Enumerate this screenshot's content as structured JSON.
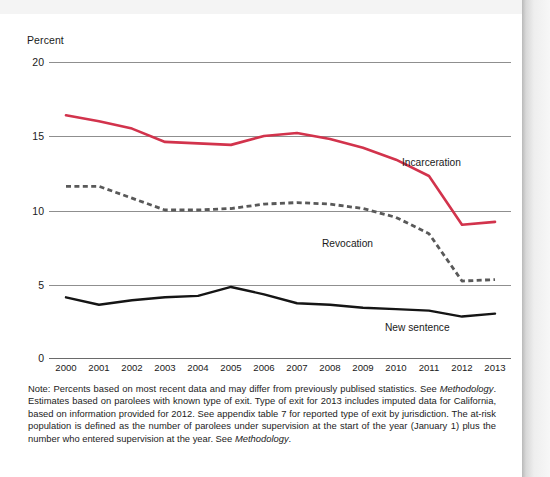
{
  "chart_data": {
    "type": "line",
    "title": "",
    "xlabel": "",
    "ylabel": "Percent",
    "ylim": [
      0,
      20
    ],
    "yticks": [
      0,
      5,
      10,
      15,
      20
    ],
    "grid": true,
    "legend_position": "inline-annotations",
    "categories": [
      "2000",
      "2001",
      "2002",
      "2003",
      "2004",
      "2005",
      "2006",
      "2007",
      "2008",
      "2009",
      "2010",
      "2011",
      "2012",
      "2013"
    ],
    "series": [
      {
        "name": "Incarceration",
        "color": "#d2334c",
        "style": "solid",
        "values": [
          16.4,
          16.0,
          15.5,
          14.6,
          14.5,
          14.4,
          15.0,
          15.2,
          14.8,
          14.2,
          13.4,
          12.3,
          9.0,
          9.2
        ]
      },
      {
        "name": "Revocation",
        "color": "#595959",
        "style": "dashed",
        "values": [
          11.6,
          11.6,
          10.8,
          10.0,
          10.0,
          10.1,
          10.4,
          10.5,
          10.4,
          10.1,
          9.5,
          8.4,
          5.2,
          5.3
        ]
      },
      {
        "name": "New sentence",
        "color": "#151515",
        "style": "solid",
        "values": [
          4.1,
          3.6,
          3.9,
          4.1,
          4.2,
          4.8,
          4.3,
          3.7,
          3.6,
          3.4,
          3.3,
          3.2,
          2.8,
          3.0
        ]
      }
    ]
  },
  "axis": {
    "y_title": "Percent",
    "y_ticks": [
      "20",
      "15",
      "10",
      "5",
      "0"
    ],
    "x_ticks": [
      "2000",
      "2001",
      "2002",
      "2003",
      "2004",
      "2005",
      "2006",
      "2007",
      "2008",
      "2009",
      "2010",
      "2011",
      "2012",
      "2013"
    ]
  },
  "annotations": {
    "incarceration": "Incarceration",
    "revocation": "Revocation",
    "new_sentence": "New sentence"
  },
  "note": {
    "part1": "Note: Percents based on most recent data and may differ from previously publised statistics. See ",
    "em1": "Methodology",
    "part2": ". Estimates based on parolees with known type of exit. Type of exit for 2013 includes imputed data for California, based on information provided for 2012. See appendix table 7 for reported type of exit by jurisdiction. The at-risk population is defined as the number of parolees under supervision at the start of the year (January 1) plus the number who entered supervision at the year. See ",
    "em2": "Methodology",
    "part3": "."
  }
}
